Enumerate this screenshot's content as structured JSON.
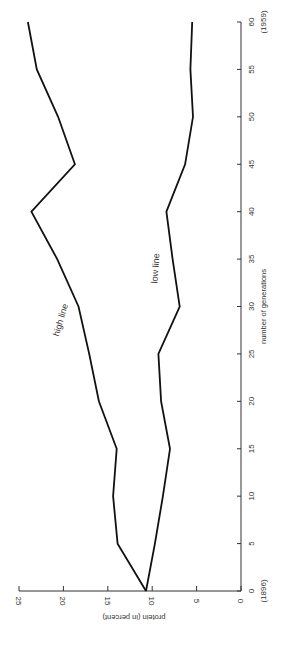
{
  "chart_data": {
    "type": "line",
    "title": "",
    "orientation": "rotated 90° counterclockwise on page",
    "xlabel": "number of generations",
    "ylabel": "protein (in percent)",
    "xlim": [
      0,
      60
    ],
    "ylim": [
      0,
      25
    ],
    "xticks": [
      0,
      5,
      10,
      15,
      20,
      25,
      30,
      35,
      40,
      45,
      50,
      55,
      60
    ],
    "yticks": [
      0,
      5,
      10,
      15,
      20,
      25
    ],
    "x_annotations": [
      {
        "x": 0,
        "text": "(1896)"
      },
      {
        "x": 60,
        "text": "(1959)"
      }
    ],
    "grid": false,
    "legend": "none (series labeled inline)",
    "x": [
      0,
      5,
      10,
      15,
      20,
      25,
      30,
      35,
      40,
      45,
      50,
      55,
      60
    ],
    "series": [
      {
        "name": "high line",
        "label": "high line",
        "color": "#111111",
        "values": [
          10.7,
          13.9,
          14.4,
          14.0,
          16.0,
          17.1,
          18.3,
          20.7,
          23.6,
          18.7,
          20.6,
          23.0,
          24.0
        ]
      },
      {
        "name": "low line",
        "label": "low line",
        "color": "#111111",
        "values": [
          10.7,
          9.7,
          8.8,
          8.0,
          9.0,
          9.3,
          6.9,
          7.7,
          8.4,
          6.3,
          5.4,
          5.7,
          5.5
        ]
      }
    ]
  }
}
